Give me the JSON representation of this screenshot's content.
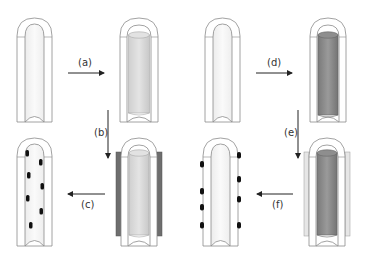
{
  "figure": {
    "type": "process-schematic",
    "colors": {
      "tube_outline": "#8a8a8a",
      "tube_fill": "#ffffff",
      "bore_shade": "#f2f2f2",
      "light_rod": "#d9d9d9",
      "light_rod_edge": "#a8a8a8",
      "dark_rod": "#8c8c8c",
      "dark_rod_edge": "#666666",
      "dark_sleeve": "#6e6e6e",
      "light_sleeve": "#e6e6e6",
      "particle": "#111111",
      "arrow": "#222222"
    },
    "steps": [
      {
        "id": "a",
        "label": "(a)",
        "direction": "right",
        "from": "empty tube",
        "to": "tube with light rod"
      },
      {
        "id": "b",
        "label": "(b)",
        "direction": "down",
        "from": "tube with light rod",
        "to": "tube with light rod and dark outer sleeve"
      },
      {
        "id": "c",
        "label": "(c)",
        "direction": "left",
        "from": "tube with dark sleeve",
        "to": "tube with particles on inner wall"
      },
      {
        "id": "d",
        "label": "(d)",
        "direction": "right",
        "from": "empty tube",
        "to": "tube with dark rod"
      },
      {
        "id": "e",
        "label": "(e)",
        "direction": "down",
        "from": "tube with dark rod",
        "to": "tube with dark rod and light outer sleeve"
      },
      {
        "id": "f",
        "label": "(f)",
        "direction": "left",
        "from": "tube with light sleeve",
        "to": "tube with particles on outer wall"
      }
    ],
    "tubes": [
      {
        "name": "empty-tube-left",
        "row": 1,
        "state": "empty"
      },
      {
        "name": "light-rod-tube",
        "row": 1,
        "state": "light rod inserted"
      },
      {
        "name": "empty-tube-right",
        "row": 1,
        "state": "empty"
      },
      {
        "name": "dark-rod-tube",
        "row": 1,
        "state": "dark rod inserted"
      },
      {
        "name": "inner-particles-tube",
        "row": 2,
        "state": "particles deposited on inner surface"
      },
      {
        "name": "dark-sleeve-tube",
        "row": 2,
        "state": "light rod inside, dark outer sleeve"
      },
      {
        "name": "outer-particles-tube",
        "row": 2,
        "state": "particles deposited on outer surface"
      },
      {
        "name": "light-sleeve-tube",
        "row": 2,
        "state": "dark rod inside, light outer sleeve"
      }
    ]
  }
}
